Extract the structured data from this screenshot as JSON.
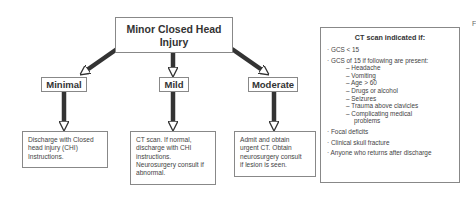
{
  "diagram": {
    "root": "Minor Closed Head Injury",
    "root_lines": [
      "Minor Closed Head",
      "Injury"
    ],
    "categories": [
      {
        "label": "Minimal",
        "outcome_lines": [
          "Discharge with Closed",
          "head injury (CHI)",
          "Instructions."
        ]
      },
      {
        "label": "Mild",
        "outcome_lines": [
          "CT scan. If normal,",
          "discharge with CHI",
          "instructions.",
          "Neurosurgery consult if",
          "abnormal."
        ]
      },
      {
        "label": "Moderate",
        "outcome_lines": [
          "Admit and obtain",
          "urgent CT. Obtain",
          "neurosurgery consult",
          "if lesion is seen."
        ]
      }
    ],
    "ct_box": {
      "heading": "CT scan indicated if:",
      "items": {
        "gcs_lt": "GCS < 15",
        "gcs15": "GCS of 15 if following are present:",
        "sub": [
          "Headache",
          "Vomiting",
          "Age > 60",
          "Drugs or alcohol",
          "Seizures",
          "Trauma above clavicles",
          "Complicating medical",
          "problems"
        ],
        "focal": "Focal deficits",
        "skull": "Clinical skull fracture",
        "returns": "Anyone who returns after discharge"
      },
      "bullet": "·",
      "dash": "–"
    },
    "cropped_letter": "F"
  }
}
